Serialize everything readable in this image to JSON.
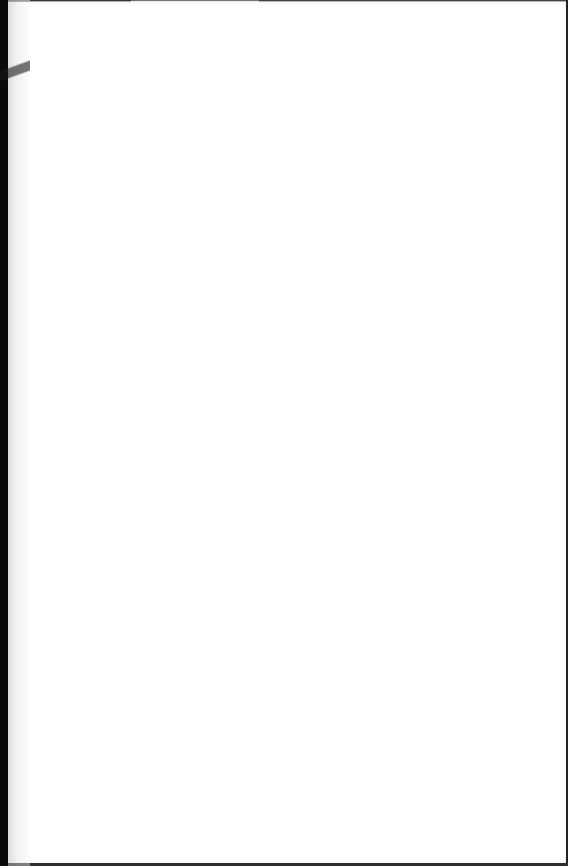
{
  "document": {
    "type": "blank-page",
    "content": "",
    "colors": {
      "page": "#ffffff",
      "background": "#0a0a0a",
      "edge": "#d9d9d9"
    }
  }
}
